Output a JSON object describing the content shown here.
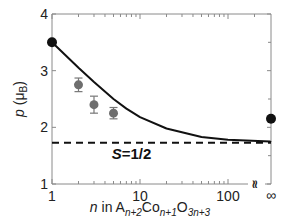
{
  "chart_data": {
    "type": "scatter",
    "title": "",
    "xlabel": "n in A_{n+2}Co_{n+1}O_{3n+3}",
    "xlabel_parts": {
      "n": "n",
      "in": " in A",
      "sub1": "n+2",
      "co": "Co",
      "sub2": "n+1",
      "o": "O",
      "sub3": "3n+3"
    },
    "ylabel": "p (μB)",
    "ylabel_parts": {
      "p": "p",
      "unit_open": " (μ",
      "unit_sub": "B",
      "unit_close": ")"
    },
    "xscale": "log",
    "xlim": [
      1,
      300
    ],
    "x_break": true,
    "x_extra_tick": "∞",
    "ylim": [
      1,
      4
    ],
    "xticks": [
      "1",
      "10",
      "100"
    ],
    "yticks": [
      "1",
      "2",
      "3",
      "4"
    ],
    "grid": false,
    "series": [
      {
        "name": "experimental (gray, with error bars)",
        "color": "#6e6e6e",
        "points": [
          {
            "x": 2,
            "y": 2.75,
            "err": 0.12
          },
          {
            "x": 3,
            "y": 2.4,
            "err": 0.15
          },
          {
            "x": 5,
            "y": 2.25,
            "err": 0.1
          }
        ]
      },
      {
        "name": "endpoint values (black)",
        "color": "#111111",
        "points": [
          {
            "x": 1,
            "y": 3.5
          },
          {
            "x": "∞",
            "y": 2.15
          }
        ]
      },
      {
        "name": "model curve",
        "type": "line",
        "style": "solid",
        "color": "#111111",
        "x": [
          1,
          2,
          3,
          5,
          7,
          10,
          20,
          50,
          100,
          300
        ],
        "y": [
          3.5,
          3.05,
          2.8,
          2.5,
          2.33,
          2.18,
          1.98,
          1.83,
          1.78,
          1.75
        ]
      },
      {
        "name": "S=1/2",
        "type": "line",
        "style": "dashed",
        "color": "#111111",
        "x": [
          1,
          300
        ],
        "y": [
          1.73,
          1.73
        ]
      }
    ],
    "annotations": [
      {
        "text": "S=1/2",
        "x": 8,
        "y": 1.45
      }
    ]
  }
}
